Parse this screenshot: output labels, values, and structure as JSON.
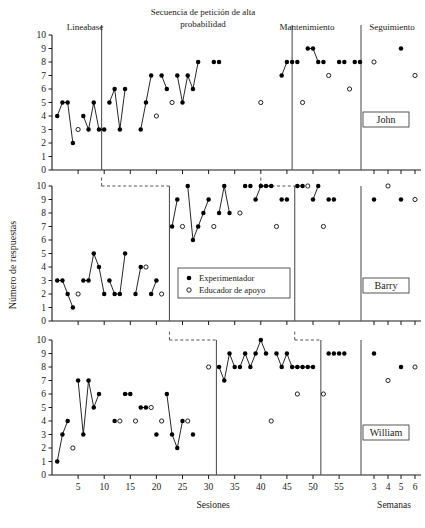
{
  "figure": {
    "y_axis_title": "Número de respuestas",
    "x_axis_title_sessions": "Sesiones",
    "x_axis_title_weeks": "Semanas",
    "y_ticks": [
      "0",
      "1",
      "2",
      "3",
      "4",
      "5",
      "6",
      "7",
      "8",
      "9",
      "10"
    ],
    "session_ticks": [
      "5",
      "10",
      "15",
      "20",
      "25",
      "30",
      "35",
      "40",
      "45",
      "50",
      "55"
    ],
    "week_ticks": [
      "3",
      "4",
      "5",
      "6"
    ],
    "phase_labels": [
      "Lineabase",
      "Secuencia de petición de alta probabilidad",
      "Mantenimiento",
      "Seguimiento"
    ],
    "legend": {
      "filled_label": "Experimentador",
      "open_label": "Educador de apoyo"
    },
    "participants": [
      "John",
      "Barry",
      "William"
    ],
    "colors": {
      "axis": "#1a1a1a",
      "marker_filled": "#000000",
      "marker_open_stroke": "#000000",
      "marker_open_fill": "#ffffff",
      "phase_line": "#555555"
    }
  },
  "chart_data": {
    "type": "line",
    "title": "",
    "xlabel": "Sesiones",
    "ylabel": "Número de respuestas",
    "xlim": [
      0,
      62
    ],
    "ylim": [
      0,
      10
    ],
    "grid": false,
    "legend_position": "middle-center",
    "panels": [
      {
        "name": "John",
        "phase_lines_sessions": [
          9.5,
          46.0,
          56.5
        ],
        "dashed_connectors": [],
        "series": [
          {
            "name": "Experimentador",
            "marker": "filled",
            "points": [
              {
                "x": 1,
                "y": 4
              },
              {
                "x": 2,
                "y": 5
              },
              {
                "x": 3,
                "y": 5
              },
              {
                "x": 4,
                "y": 2
              },
              {
                "x": 6,
                "y": 4
              },
              {
                "x": 7,
                "y": 3
              },
              {
                "x": 8,
                "y": 5
              },
              {
                "x": 9,
                "y": 3
              },
              {
                "x": 10,
                "y": 3
              },
              {
                "x": 11,
                "y": 5
              },
              {
                "x": 12,
                "y": 6
              },
              {
                "x": 13,
                "y": 3
              },
              {
                "x": 14,
                "y": 6
              },
              {
                "x": 17,
                "y": 3
              },
              {
                "x": 18,
                "y": 5
              },
              {
                "x": 19,
                "y": 7
              },
              {
                "x": 21,
                "y": 7
              },
              {
                "x": 22,
                "y": 6
              },
              {
                "x": 24,
                "y": 7
              },
              {
                "x": 25,
                "y": 5
              },
              {
                "x": 26,
                "y": 7
              },
              {
                "x": 27,
                "y": 6
              },
              {
                "x": 28,
                "y": 8
              },
              {
                "x": 31,
                "y": 8
              },
              {
                "x": 32,
                "y": 8
              },
              {
                "x": 44,
                "y": 7
              },
              {
                "x": 45,
                "y": 8
              },
              {
                "x": 46,
                "y": 8
              },
              {
                "x": 47,
                "y": 8
              },
              {
                "x": 49,
                "y": 9
              },
              {
                "x": 50,
                "y": 9
              },
              {
                "x": 51,
                "y": 8
              },
              {
                "x": 52,
                "y": 8
              },
              {
                "x": 55,
                "y": 8
              },
              {
                "x": 56,
                "y": 8
              },
              {
                "x": 58,
                "y": 8
              },
              {
                "x": 59,
                "y": 8
              }
            ],
            "connected_segments": [
              [
                1,
                2,
                3,
                4
              ],
              [
                6,
                7,
                8,
                9,
                10
              ],
              [
                11,
                12,
                13,
                14
              ],
              [
                17,
                18,
                19
              ],
              [
                21,
                22
              ],
              [
                24,
                25,
                26,
                27,
                28
              ],
              [
                44,
                45
              ],
              [
                49,
                50,
                51
              ]
            ]
          },
          {
            "name": "Educador de apoyo",
            "marker": "open",
            "points": [
              {
                "x": 5,
                "y": 3
              },
              {
                "x": 20,
                "y": 4
              },
              {
                "x": 23,
                "y": 5
              },
              {
                "x": 40,
                "y": 5
              },
              {
                "x": 48,
                "y": 5
              },
              {
                "x": 53,
                "y": 7
              },
              {
                "x": 57,
                "y": 6
              }
            ]
          }
        ],
        "followup": {
          "filled": [
            {
              "week": 5,
              "y": 9
            }
          ],
          "open": [
            {
              "week": 3,
              "y": 8
            },
            {
              "week": 6,
              "y": 7
            }
          ]
        }
      },
      {
        "name": "Barry",
        "phase_lines_sessions": [
          22.5,
          46.5,
          56.5
        ],
        "dashed_connectors": [
          {
            "from_x": 9.5,
            "to_x": 22.5,
            "y": 10
          },
          {
            "from_x": 40.0,
            "to_x": 46.5,
            "y": 10
          }
        ],
        "series": [
          {
            "name": "Experimentador",
            "marker": "filled",
            "points": [
              {
                "x": 1,
                "y": 3
              },
              {
                "x": 2,
                "y": 3
              },
              {
                "x": 3,
                "y": 2
              },
              {
                "x": 4,
                "y": 1
              },
              {
                "x": 6,
                "y": 3
              },
              {
                "x": 7,
                "y": 3
              },
              {
                "x": 8,
                "y": 5
              },
              {
                "x": 9,
                "y": 4
              },
              {
                "x": 10,
                "y": 2
              },
              {
                "x": 11,
                "y": 3
              },
              {
                "x": 12,
                "y": 2
              },
              {
                "x": 13,
                "y": 2
              },
              {
                "x": 14,
                "y": 5
              },
              {
                "x": 16,
                "y": 2
              },
              {
                "x": 17,
                "y": 4
              },
              {
                "x": 19,
                "y": 2
              },
              {
                "x": 20,
                "y": 3
              },
              {
                "x": 23,
                "y": 7
              },
              {
                "x": 24,
                "y": 9
              },
              {
                "x": 26,
                "y": 10
              },
              {
                "x": 27,
                "y": 6
              },
              {
                "x": 28,
                "y": 7
              },
              {
                "x": 29,
                "y": 8
              },
              {
                "x": 30,
                "y": 9
              },
              {
                "x": 32,
                "y": 8
              },
              {
                "x": 33,
                "y": 10
              },
              {
                "x": 34,
                "y": 8
              },
              {
                "x": 37,
                "y": 10
              },
              {
                "x": 38,
                "y": 10
              },
              {
                "x": 39,
                "y": 9
              },
              {
                "x": 40,
                "y": 10
              },
              {
                "x": 41,
                "y": 10
              },
              {
                "x": 42,
                "y": 10
              },
              {
                "x": 44,
                "y": 9
              },
              {
                "x": 45,
                "y": 9
              },
              {
                "x": 47,
                "y": 10
              },
              {
                "x": 48,
                "y": 10
              },
              {
                "x": 50,
                "y": 9
              },
              {
                "x": 51,
                "y": 10
              },
              {
                "x": 53,
                "y": 9
              },
              {
                "x": 54,
                "y": 9
              }
            ],
            "connected_segments": [
              [
                1,
                2,
                3,
                4
              ],
              [
                6,
                7,
                8,
                9,
                10
              ],
              [
                11,
                12,
                13,
                14
              ],
              [
                16,
                17
              ],
              [
                19,
                20
              ],
              [
                23,
                24
              ],
              [
                26,
                27,
                28,
                29,
                30
              ],
              [
                32,
                33,
                34
              ],
              [
                39,
                40,
                41,
                42
              ],
              [
                47,
                48
              ],
              [
                50,
                51
              ]
            ]
          },
          {
            "name": "Educador de apoyo",
            "marker": "open",
            "points": [
              {
                "x": 5,
                "y": 2
              },
              {
                "x": 18,
                "y": 4
              },
              {
                "x": 21,
                "y": 2
              },
              {
                "x": 25,
                "y": 7
              },
              {
                "x": 31,
                "y": 7
              },
              {
                "x": 36,
                "y": 8
              },
              {
                "x": 43,
                "y": 7
              },
              {
                "x": 49,
                "y": 10
              },
              {
                "x": 52,
                "y": 7
              }
            ]
          }
        ],
        "followup": {
          "filled": [
            {
              "week": 3,
              "y": 9
            },
            {
              "week": 5,
              "y": 9
            }
          ],
          "open": [
            {
              "week": 4,
              "y": 10
            },
            {
              "week": 6,
              "y": 9
            }
          ]
        }
      },
      {
        "name": "William",
        "phase_lines_sessions": [
          31.5,
          51.5,
          56.5
        ],
        "dashed_connectors": [
          {
            "from_x": 22.5,
            "to_x": 31.5,
            "y": 10
          },
          {
            "from_x": 46.5,
            "to_x": 51.5,
            "y": 10
          }
        ],
        "series": [
          {
            "name": "Experimentador",
            "marker": "filled",
            "points": [
              {
                "x": 1,
                "y": 1
              },
              {
                "x": 2,
                "y": 3
              },
              {
                "x": 3,
                "y": 4
              },
              {
                "x": 5,
                "y": 7
              },
              {
                "x": 6,
                "y": 3
              },
              {
                "x": 7,
                "y": 7
              },
              {
                "x": 8,
                "y": 5
              },
              {
                "x": 9,
                "y": 6
              },
              {
                "x": 12,
                "y": 4
              },
              {
                "x": 14,
                "y": 6
              },
              {
                "x": 15,
                "y": 6
              },
              {
                "x": 17,
                "y": 5
              },
              {
                "x": 18,
                "y": 5
              },
              {
                "x": 20,
                "y": 3
              },
              {
                "x": 22,
                "y": 6
              },
              {
                "x": 23,
                "y": 3
              },
              {
                "x": 24,
                "y": 2
              },
              {
                "x": 25,
                "y": 4
              },
              {
                "x": 27,
                "y": 3
              },
              {
                "x": 32,
                "y": 8
              },
              {
                "x": 33,
                "y": 7
              },
              {
                "x": 34,
                "y": 9
              },
              {
                "x": 35,
                "y": 8
              },
              {
                "x": 36,
                "y": 8
              },
              {
                "x": 37,
                "y": 9
              },
              {
                "x": 38,
                "y": 8
              },
              {
                "x": 39,
                "y": 9
              },
              {
                "x": 40,
                "y": 10
              },
              {
                "x": 41,
                "y": 9
              },
              {
                "x": 43,
                "y": 9
              },
              {
                "x": 44,
                "y": 8
              },
              {
                "x": 45,
                "y": 9
              },
              {
                "x": 46,
                "y": 8
              },
              {
                "x": 47,
                "y": 8
              },
              {
                "x": 48,
                "y": 8
              },
              {
                "x": 49,
                "y": 8
              },
              {
                "x": 50,
                "y": 8
              },
              {
                "x": 53,
                "y": 9
              },
              {
                "x": 54,
                "y": 9
              },
              {
                "x": 55,
                "y": 9
              },
              {
                "x": 56,
                "y": 9
              }
            ],
            "connected_segments": [
              [
                1,
                2,
                3
              ],
              [
                5,
                6,
                7,
                8,
                9
              ],
              [
                14,
                15
              ],
              [
                17,
                18
              ],
              [
                22,
                23,
                24,
                25
              ],
              [
                32,
                33,
                34,
                35
              ],
              [
                36,
                37,
                38,
                39,
                40,
                41
              ],
              [
                43,
                44,
                45,
                46,
                47,
                48,
                49,
                50
              ]
            ]
          },
          {
            "name": "Educador de apoyo",
            "marker": "open",
            "points": [
              {
                "x": 4,
                "y": 2
              },
              {
                "x": 13,
                "y": 4
              },
              {
                "x": 16,
                "y": 4
              },
              {
                "x": 19,
                "y": 5
              },
              {
                "x": 21,
                "y": 4
              },
              {
                "x": 26,
                "y": 4
              },
              {
                "x": 30,
                "y": 8
              },
              {
                "x": 42,
                "y": 4
              },
              {
                "x": 47,
                "y": 6
              },
              {
                "x": 52,
                "y": 6
              }
            ]
          }
        ],
        "followup": {
          "filled": [
            {
              "week": 3,
              "y": 9
            },
            {
              "week": 5,
              "y": 8
            }
          ],
          "open": [
            {
              "week": 4,
              "y": 7
            },
            {
              "week": 6,
              "y": 8
            }
          ]
        }
      }
    ]
  }
}
